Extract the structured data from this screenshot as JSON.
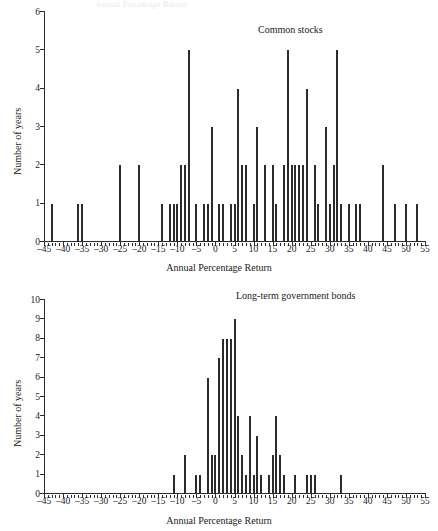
{
  "page": {
    "partial_top_text": "Annual Percentage Return"
  },
  "charts": [
    {
      "id": "stocks",
      "series_label": "Common stocks",
      "xlabel": "Annual Percentage Return",
      "ylabel": "Number of years",
      "yticks": [
        "0",
        "1",
        "2",
        "3",
        "4",
        "5",
        "6"
      ],
      "xticks": [
        "–45",
        "–40",
        "–35",
        "–30",
        "–25",
        "–20",
        "–15",
        "–10",
        "–5",
        "0",
        "5",
        "10",
        "15",
        "20",
        "25",
        "30",
        "35",
        "40",
        "45",
        "50",
        "55"
      ]
    },
    {
      "id": "bonds",
      "series_label": "Long-term government bonds",
      "xlabel": "Annual Percentage Return",
      "ylabel": "Number of years",
      "yticks": [
        "0",
        "1",
        "2",
        "3",
        "4",
        "5",
        "6",
        "7",
        "8",
        "9",
        "10"
      ],
      "xticks": [
        "–45",
        "–40",
        "–35",
        "–30",
        "–25",
        "–20",
        "–15",
        "–10",
        "–5",
        "0",
        "5",
        "10",
        "15",
        "20",
        "25",
        "30",
        "35",
        "40",
        "45",
        "50",
        "55"
      ]
    }
  ],
  "chart_data": [
    {
      "type": "bar",
      "id": "stocks",
      "title": "Common stocks",
      "xlabel": "Annual Percentage Return",
      "ylabel": "Number of years",
      "xlim": [
        -45,
        55
      ],
      "ylim": [
        0,
        6
      ],
      "ytick_step": 1,
      "xtick_step": 5,
      "minor_tick_step": 1,
      "grid": false,
      "legend": "none",
      "annotation_position": "top-right",
      "x": [
        -43,
        -36,
        -35,
        -25,
        -20,
        -14,
        -12,
        -11,
        -10,
        -9,
        -8,
        -7,
        -5,
        -3,
        -2,
        -1,
        1,
        2,
        4,
        5,
        6,
        7,
        8,
        10,
        11,
        13,
        15,
        16,
        18,
        19,
        20,
        21,
        22,
        23,
        24,
        26,
        27,
        29,
        30,
        31,
        32,
        33,
        35,
        37,
        38,
        44,
        47,
        50,
        53
      ],
      "values": [
        1,
        1,
        1,
        2,
        2,
        1,
        1,
        1,
        1,
        2,
        2,
        5,
        1,
        1,
        1,
        3,
        1,
        1,
        1,
        1,
        4,
        2,
        2,
        1,
        3,
        2,
        2,
        1,
        2,
        5,
        2,
        2,
        2,
        2,
        4,
        2,
        1,
        3,
        1,
        2,
        5,
        1,
        1,
        1,
        1,
        2,
        1,
        1,
        1
      ]
    },
    {
      "type": "bar",
      "id": "bonds",
      "title": "Long-term government bonds",
      "xlabel": "Annual Percentage Return",
      "ylabel": "Number of years",
      "xlim": [
        -45,
        55
      ],
      "ylim": [
        0,
        10
      ],
      "ytick_step": 1,
      "xtick_step": 5,
      "minor_tick_step": 1,
      "grid": false,
      "legend": "none",
      "annotation_position": "top-right",
      "x": [
        -11,
        -8,
        -5,
        -4,
        -2,
        -1,
        0,
        1,
        2,
        3,
        4,
        5,
        6,
        7,
        8,
        9,
        10,
        11,
        12,
        14,
        15,
        16,
        17,
        18,
        21,
        24,
        25,
        26,
        33
      ],
      "values": [
        1,
        2,
        1,
        1,
        6,
        2,
        2,
        7,
        8,
        8,
        8,
        9,
        4,
        2,
        1,
        4,
        1,
        3,
        1,
        1,
        2,
        4,
        2,
        1,
        1,
        1,
        1,
        1,
        1
      ]
    }
  ]
}
